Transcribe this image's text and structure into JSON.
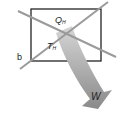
{
  "diagram": {
    "labels": {
      "q": "Q",
      "q_sub": "H",
      "t": "T",
      "t_sub": "H",
      "b": "b",
      "w": "W"
    },
    "colors": {
      "rect": "#111111",
      "lines": "#9a9a9a",
      "arrow_light": "#c8c8c8",
      "arrow_dark": "#7a7a7a"
    }
  }
}
